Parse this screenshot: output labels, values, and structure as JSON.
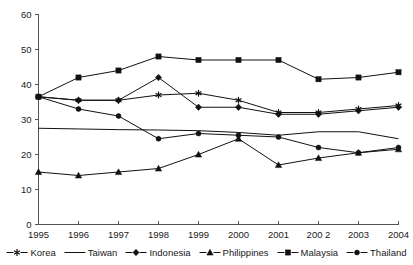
{
  "chart_data": {
    "type": "line",
    "title": "",
    "subtitle": "",
    "xlabel": "",
    "ylabel": "",
    "grid": false,
    "legend_position": "bottom",
    "categories": [
      "1995",
      "1996",
      "1997",
      "1998",
      "1999",
      "2000",
      "2001",
      "200 2",
      "2003",
      "2004"
    ],
    "x": [
      1995,
      1996,
      1997,
      1998,
      1999,
      2000,
      2001,
      2002,
      2003,
      2004
    ],
    "xlim": [
      1995,
      2004
    ],
    "ylim": [
      0,
      60
    ],
    "yticks": [
      0,
      10,
      20,
      30,
      40,
      50,
      60
    ],
    "ytick_labels": [
      "0",
      "10",
      "20",
      "30",
      "40",
      "50",
      "60"
    ],
    "series": [
      {
        "name": "Korea",
        "marker": "asterisk",
        "values": [
          36.5,
          35.5,
          35.5,
          37.0,
          37.5,
          35.5,
          32.0,
          32.0,
          33.0,
          34.0
        ]
      },
      {
        "name": "Taiwan",
        "marker": "none",
        "values": [
          27.5,
          27.3,
          27.1,
          27.0,
          26.8,
          26.3,
          25.5,
          26.5,
          26.5,
          24.5
        ]
      },
      {
        "name": "Indonesia",
        "marker": "diamond",
        "values": [
          36.5,
          35.5,
          35.5,
          42.0,
          33.5,
          33.5,
          31.5,
          31.5,
          32.5,
          33.5
        ]
      },
      {
        "name": "Philippines",
        "marker": "triangle",
        "values": [
          15.0,
          14.0,
          15.0,
          16.0,
          20.0,
          24.5,
          17.0,
          19.0,
          20.5,
          21.5
        ]
      },
      {
        "name": "Malaysia",
        "marker": "square",
        "values": [
          36.5,
          42.0,
          44.0,
          48.0,
          47.0,
          47.0,
          47.0,
          41.5,
          42.0,
          43.5
        ]
      },
      {
        "name": "Thailand",
        "marker": "circle",
        "values": [
          36.5,
          33.0,
          31.0,
          24.5,
          26.0,
          25.5,
          25.0,
          22.0,
          20.5,
          22.0
        ]
      }
    ]
  },
  "colors": {
    "line": "#111111",
    "axis": "#555555",
    "text": "#1a1a1a",
    "background": "#ffffff"
  }
}
